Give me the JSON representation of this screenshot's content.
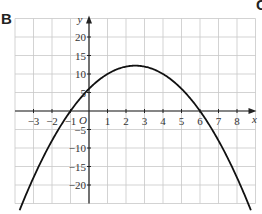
{
  "panel_label": "B",
  "partial_label": "C",
  "chart_data": {
    "type": "line",
    "title": "",
    "xlabel": "x",
    "ylabel": "y",
    "origin_label": "O",
    "xlim": [
      -4,
      9
    ],
    "ylim": [
      -25,
      25
    ],
    "grid": true,
    "x_ticks": [
      -3,
      -2,
      -1,
      1,
      2,
      3,
      4,
      5,
      6,
      7,
      8
    ],
    "x_tick_labels": [
      "−3",
      "−2",
      "−1",
      "1",
      "2",
      "3",
      "4",
      "5",
      "6",
      "7",
      "8"
    ],
    "y_ticks": [
      20,
      15,
      10,
      5,
      -5,
      -10,
      -15,
      -20
    ],
    "y_tick_labels": [
      "20",
      "15",
      "10",
      "5",
      "−5",
      "−10",
      "−15",
      "−20"
    ],
    "series": [
      {
        "name": "y = -x^2 + 5x + 6",
        "equation": "y = -(x+1)(x-6)",
        "roots": [
          -1,
          6
        ],
        "y_intercept": 6,
        "vertex": [
          2.5,
          12.25
        ],
        "x": [
          -3.7,
          -3,
          -2,
          -1,
          0,
          1,
          2,
          2.5,
          3,
          4,
          5,
          6,
          7,
          8,
          8.7
        ],
        "y": [
          -24.2,
          -18,
          -8,
          0,
          6,
          10,
          12,
          12.25,
          12,
          10,
          6,
          0,
          -8,
          -18,
          -24.2
        ]
      }
    ],
    "colors": {
      "curve": "#111111",
      "grid": "#c8c8c8",
      "axis": "#222222"
    }
  }
}
